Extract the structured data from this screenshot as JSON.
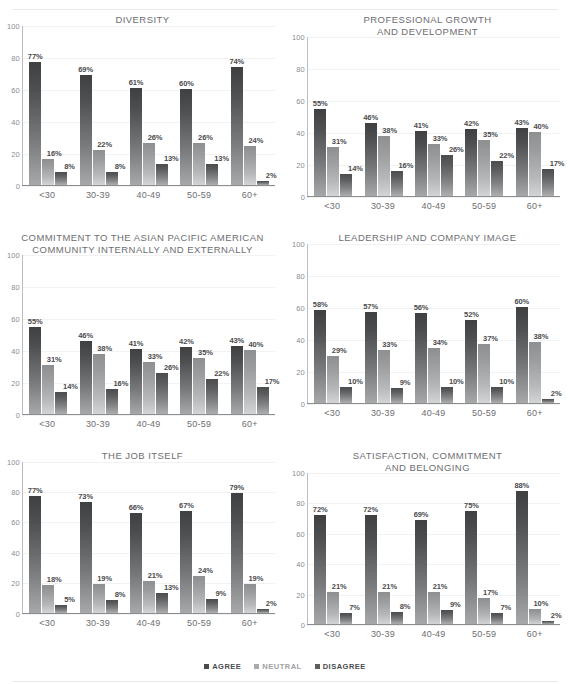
{
  "legend": {
    "items": [
      {
        "label": "AGREE",
        "color": "#4a4b4d"
      },
      {
        "label": "NEUTRAL",
        "color": "#a9aaac"
      },
      {
        "label": "DISAGREE",
        "color": "#5d5e60"
      }
    ]
  },
  "axis": {
    "yticks": [
      "100",
      "80",
      "60",
      "40",
      "20",
      "0"
    ],
    "categories": [
      "<30",
      "30-39",
      "40-49",
      "50-59",
      "60+"
    ]
  },
  "chart_data": [
    {
      "type": "bar",
      "title": "DIVERSITY",
      "xlabel": "",
      "ylabel": "",
      "ylim": [
        0,
        100
      ],
      "grid": true,
      "legend_position": "bottom",
      "categories": [
        "<30",
        "30-39",
        "40-49",
        "50-59",
        "60+"
      ],
      "series": [
        {
          "name": "AGREE",
          "values": [
            77,
            69,
            61,
            60,
            74
          ],
          "labels": [
            "77%",
            "69%",
            "61%",
            "60%",
            "74%"
          ]
        },
        {
          "name": "NEUTRAL",
          "values": [
            16,
            22,
            26,
            26,
            24
          ],
          "labels": [
            "16%",
            "22%",
            "26%",
            "26%",
            "24%"
          ]
        },
        {
          "name": "DISAGREE",
          "values": [
            8,
            8,
            13,
            13,
            2
          ],
          "labels": [
            "8%",
            "8%",
            "13%",
            "13%",
            "2%"
          ]
        }
      ]
    },
    {
      "type": "bar",
      "title": "PROFESSIONAL GROWTH\nAND DEVELOPMENT",
      "xlabel": "",
      "ylabel": "",
      "ylim": [
        0,
        100
      ],
      "grid": true,
      "legend_position": "bottom",
      "categories": [
        "<30",
        "30-39",
        "40-49",
        "50-59",
        "60+"
      ],
      "series": [
        {
          "name": "AGREE",
          "values": [
            55,
            46,
            41,
            42,
            43
          ],
          "labels": [
            "55%",
            "46%",
            "41%",
            "42%",
            "43%"
          ]
        },
        {
          "name": "NEUTRAL",
          "values": [
            31,
            38,
            33,
            35,
            40
          ],
          "labels": [
            "31%",
            "38%",
            "33%",
            "35%",
            "40%"
          ]
        },
        {
          "name": "DISAGREE",
          "values": [
            14,
            16,
            26,
            22,
            17
          ],
          "labels": [
            "14%",
            "16%",
            "26%",
            "22%",
            "17%"
          ]
        }
      ]
    },
    {
      "type": "bar",
      "title": "COMMITMENT TO THE ASIAN PACIFIC AMERICAN\nCOMMUNITY INTERNALLY AND EXTERNALLY",
      "xlabel": "",
      "ylabel": "",
      "ylim": [
        0,
        100
      ],
      "grid": true,
      "legend_position": "bottom",
      "categories": [
        "<30",
        "30-39",
        "40-49",
        "50-59",
        "60+"
      ],
      "series": [
        {
          "name": "AGREE",
          "values": [
            55,
            46,
            41,
            42,
            43
          ],
          "labels": [
            "55%",
            "46%",
            "41%",
            "42%",
            "43%"
          ]
        },
        {
          "name": "NEUTRAL",
          "values": [
            31,
            38,
            33,
            35,
            40
          ],
          "labels": [
            "31%",
            "38%",
            "33%",
            "35%",
            "40%"
          ]
        },
        {
          "name": "DISAGREE",
          "values": [
            14,
            16,
            26,
            22,
            17
          ],
          "labels": [
            "14%",
            "16%",
            "26%",
            "22%",
            "17%"
          ]
        }
      ]
    },
    {
      "type": "bar",
      "title": "LEADERSHIP AND COMPANY IMAGE",
      "xlabel": "",
      "ylabel": "",
      "ylim": [
        0,
        100
      ],
      "grid": true,
      "legend_position": "bottom",
      "categories": [
        "<30",
        "30-39",
        "40-49",
        "50-59",
        "60+"
      ],
      "series": [
        {
          "name": "AGREE",
          "values": [
            58,
            57,
            56,
            52,
            60
          ],
          "labels": [
            "58%",
            "57%",
            "56%",
            "52%",
            "60%"
          ]
        },
        {
          "name": "NEUTRAL",
          "values": [
            29,
            33,
            34,
            37,
            38
          ],
          "labels": [
            "29%",
            "33%",
            "34%",
            "37%",
            "38%"
          ]
        },
        {
          "name": "DISAGREE",
          "values": [
            10,
            9,
            10,
            10,
            2
          ],
          "labels": [
            "10%",
            "9%",
            "10%",
            "10%",
            "2%"
          ]
        }
      ]
    },
    {
      "type": "bar",
      "title": "THE JOB ITSELF",
      "xlabel": "",
      "ylabel": "",
      "ylim": [
        0,
        100
      ],
      "grid": true,
      "legend_position": "bottom",
      "categories": [
        "<30",
        "30-39",
        "40-49",
        "50-59",
        "60+"
      ],
      "series": [
        {
          "name": "AGREE",
          "values": [
            77,
            73,
            66,
            67,
            79
          ],
          "labels": [
            "77%",
            "73%",
            "66%",
            "67%",
            "79%"
          ]
        },
        {
          "name": "NEUTRAL",
          "values": [
            18,
            19,
            21,
            24,
            19
          ],
          "labels": [
            "18%",
            "19%",
            "21%",
            "24%",
            "19%"
          ]
        },
        {
          "name": "DISAGREE",
          "values": [
            5,
            8,
            13,
            9,
            2
          ],
          "labels": [
            "5%",
            "8%",
            "13%",
            "9%",
            "2%"
          ]
        }
      ]
    },
    {
      "type": "bar",
      "title": "SATISFACTION, COMMITMENT\nAND BELONGING",
      "xlabel": "",
      "ylabel": "",
      "ylim": [
        0,
        100
      ],
      "grid": true,
      "legend_position": "bottom",
      "categories": [
        "<30",
        "30-39",
        "40-49",
        "50-59",
        "60+"
      ],
      "series": [
        {
          "name": "AGREE",
          "values": [
            72,
            72,
            69,
            75,
            88
          ],
          "labels": [
            "72%",
            "72%",
            "69%",
            "75%",
            "88%"
          ]
        },
        {
          "name": "NEUTRAL",
          "values": [
            21,
            21,
            21,
            17,
            10
          ],
          "labels": [
            "21%",
            "21%",
            "21%",
            "17%",
            "10%"
          ]
        },
        {
          "name": "DISAGREE",
          "values": [
            7,
            8,
            9,
            7,
            2
          ],
          "labels": [
            "7%",
            "8%",
            "9%",
            "7%",
            "2%"
          ]
        }
      ]
    }
  ]
}
